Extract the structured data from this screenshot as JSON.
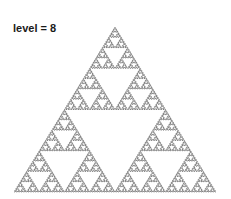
{
  "title": "level = 8",
  "diagram": {
    "type": "sierpinski-arrowhead-curve",
    "level": 8,
    "stroke_color": "#2a2a2a",
    "background": "#ffffff",
    "apex": [
      116,
      27
    ],
    "bottom_left": [
      14,
      192
    ],
    "bottom_right": [
      216,
      192
    ]
  }
}
